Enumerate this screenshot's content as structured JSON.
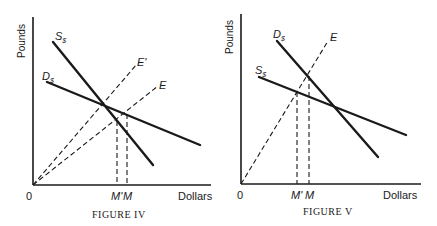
{
  "figures": [
    {
      "caption": "FIGURE IV",
      "y_axis_label": "Pounds",
      "x_axis_label": "Dollars",
      "origin_label": "0",
      "curves": [
        {
          "label": "S",
          "subscript": "$",
          "type": "solid"
        },
        {
          "label": "D",
          "subscript": "$",
          "type": "solid"
        },
        {
          "label": "E'",
          "type": "dashed"
        },
        {
          "label": "E",
          "type": "dashed"
        }
      ],
      "x_ticks": [
        {
          "label": "M'"
        },
        {
          "label": "M"
        }
      ]
    },
    {
      "caption": "FIGURE V",
      "y_axis_label": "Pounds",
      "x_axis_label": "Dollars",
      "origin_label": "0",
      "curves": [
        {
          "label": "D",
          "subscript": "$",
          "type": "solid"
        },
        {
          "label": "S",
          "subscript": "$",
          "type": "solid"
        },
        {
          "label": "E",
          "type": "dashed"
        }
      ],
      "x_ticks": [
        {
          "label": "M'"
        },
        {
          "label": "M"
        }
      ]
    }
  ]
}
